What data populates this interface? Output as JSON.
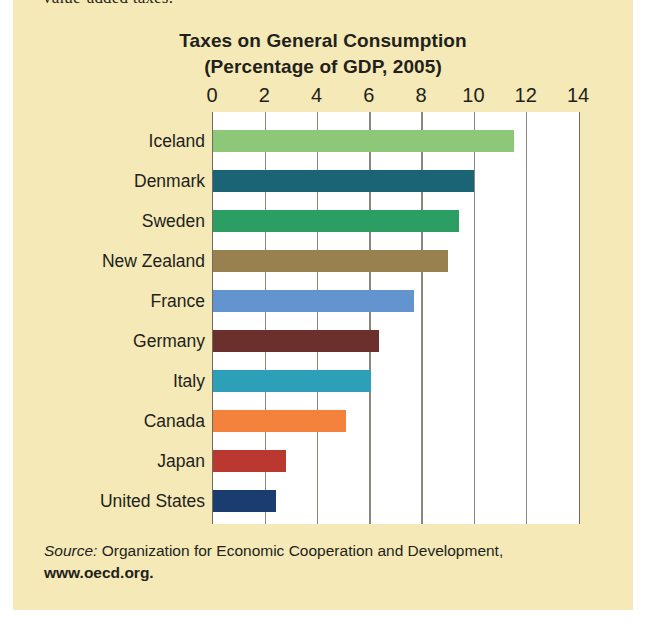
{
  "page": {
    "cutoff_text": "value-added taxes.",
    "panel_color": "#f4e9b7",
    "plot_bg": "#ffffff"
  },
  "chart_data": {
    "type": "bar",
    "orientation": "horizontal",
    "title": "Taxes on General Consumption",
    "subtitle": "(Percentage of GDP, 2005)",
    "xlabel": "",
    "ylabel": "",
    "xlim": [
      0,
      14
    ],
    "xticks": [
      0,
      2,
      4,
      6,
      8,
      10,
      12,
      14
    ],
    "xtick_labels": [
      "0",
      "2",
      "4",
      "6",
      "8",
      "10",
      "12",
      "14"
    ],
    "grid": true,
    "legend": false,
    "categories": [
      "Iceland",
      "Denmark",
      "Sweden",
      "New Zealand",
      "France",
      "Germany",
      "Italy",
      "Canada",
      "Japan",
      "United States"
    ],
    "values": [
      11.5,
      10.0,
      9.4,
      9.0,
      7.7,
      6.35,
      6.05,
      5.1,
      2.8,
      2.4
    ],
    "colors": [
      "#8cc878",
      "#1b6476",
      "#2a9e63",
      "#99814f",
      "#6394cf",
      "#6b2f2c",
      "#2d9fb8",
      "#f4813c",
      "#bb3831",
      "#1b3c6e"
    ],
    "bars": [
      {
        "label": "Iceland",
        "value": 11.5,
        "color": "#8cc878"
      },
      {
        "label": "Denmark",
        "value": 10.0,
        "color": "#1b6476"
      },
      {
        "label": "Sweden",
        "value": 9.4,
        "color": "#2a9e63"
      },
      {
        "label": "New Zealand",
        "value": 9.0,
        "color": "#99814f"
      },
      {
        "label": "France",
        "value": 7.7,
        "color": "#6394cf"
      },
      {
        "label": "Germany",
        "value": 6.35,
        "color": "#6b2f2c"
      },
      {
        "label": "Italy",
        "value": 6.05,
        "color": "#2d9fb8"
      },
      {
        "label": "Canada",
        "value": 5.1,
        "color": "#f4813c"
      },
      {
        "label": "Japan",
        "value": 2.8,
        "color": "#bb3831"
      },
      {
        "label": "United States",
        "value": 2.4,
        "color": "#1b3c6e"
      }
    ]
  },
  "source": {
    "prefix": "Source:",
    "text": " Organization for Economic Cooperation and Development,",
    "url": "www.oecd.org."
  }
}
